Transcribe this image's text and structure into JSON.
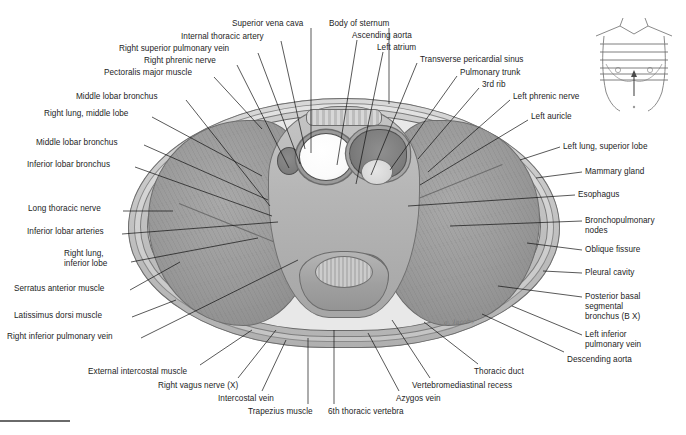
{
  "plate": {
    "title": "Transverse section of the thorax",
    "signature": "a. Jacobs"
  },
  "labels_top": [
    {
      "text": "Superior vena cava",
      "x": 232,
      "y": 19,
      "align": "l",
      "x1": 311,
      "y1": 28,
      "x2": 311,
      "y2": 153
    },
    {
      "text": "Body of sternum",
      "x": 329,
      "y": 19,
      "align": "l",
      "x1": 389,
      "y1": 28,
      "x2": 389,
      "y2": 104
    },
    {
      "text": "Ascending aorta",
      "x": 352,
      "y": 31,
      "align": "l",
      "x1": 357,
      "y1": 40,
      "x2": 337,
      "y2": 165
    },
    {
      "text": "Internal thoracic artery",
      "x": 181,
      "y": 32,
      "align": "l",
      "x1": 281,
      "y1": 41,
      "x2": 305,
      "y2": 149
    },
    {
      "text": "Left atrium",
      "x": 377,
      "y": 43,
      "align": "l",
      "x1": 383,
      "y1": 52,
      "x2": 356,
      "y2": 184
    },
    {
      "text": "Right superior pulmonary vein",
      "x": 119,
      "y": 44,
      "align": "l",
      "x1": 258,
      "y1": 53,
      "x2": 300,
      "y2": 164
    },
    {
      "text": "Transverse pericardial sinus",
      "x": 420,
      "y": 55,
      "align": "l",
      "x1": 417,
      "y1": 63,
      "x2": 371,
      "y2": 175
    },
    {
      "text": "Right phrenic nerve",
      "x": 144,
      "y": 56,
      "align": "l",
      "x1": 237,
      "y1": 65,
      "x2": 289,
      "y2": 168
    },
    {
      "text": "Pulmonary trunk",
      "x": 460,
      "y": 68,
      "align": "l",
      "x1": 457,
      "y1": 76,
      "x2": 390,
      "y2": 170
    },
    {
      "text": "3rd rib",
      "x": 482,
      "y": 80,
      "align": "l",
      "x1": 479,
      "y1": 88,
      "x2": 418,
      "y2": 159
    },
    {
      "text": "Pectoralis major muscle",
      "x": 104,
      "y": 68,
      "align": "l",
      "x1": 214,
      "y1": 77,
      "x2": 262,
      "y2": 129
    },
    {
      "text": "Left phrenic nerve",
      "x": 513,
      "y": 92,
      "align": "l",
      "x1": 510,
      "y1": 100,
      "x2": 428,
      "y2": 172
    },
    {
      "text": "Middle lobar bronchus",
      "x": 76,
      "y": 92,
      "align": "l",
      "x1": 186,
      "y1": 100,
      "x2": 270,
      "y2": 206
    },
    {
      "text": "Left auricle",
      "x": 531,
      "y": 112,
      "align": "l",
      "x1": 528,
      "y1": 120,
      "x2": 420,
      "y2": 185
    }
  ],
  "labels_left": [
    {
      "text": "Right lung, middle lobe",
      "x": 44,
      "y": 109,
      "align": "l",
      "x1": 152,
      "y1": 117,
      "x2": 262,
      "y2": 176
    },
    {
      "text": "Middle lobar bronchus",
      "x": 36,
      "y": 138,
      "align": "l",
      "x1": 144,
      "y1": 145,
      "x2": 268,
      "y2": 200
    },
    {
      "text": "Inferior lobar bronchus",
      "x": 27,
      "y": 160,
      "align": "l",
      "x1": 135,
      "y1": 167,
      "x2": 272,
      "y2": 216
    },
    {
      "text": "Long thoracic nerve",
      "x": 28,
      "y": 204,
      "align": "l",
      "x1": 123,
      "y1": 211,
      "x2": 173,
      "y2": 211
    },
    {
      "text": "Inferior lobar arteries",
      "x": 27,
      "y": 227,
      "align": "l",
      "x1": 122,
      "y1": 234,
      "x2": 278,
      "y2": 222
    },
    {
      "text": "Right lung,",
      "x": 64,
      "y": 249,
      "align": "l",
      "x1": 131,
      "y1": 262,
      "x2": 258,
      "y2": 238
    },
    {
      "text": "inferior lobe",
      "x": 64,
      "y": 259,
      "align": "l"
    },
    {
      "text": "Serratus anterior muscle",
      "x": 14,
      "y": 284,
      "align": "l",
      "x1": 130,
      "y1": 290,
      "x2": 180,
      "y2": 262
    },
    {
      "text": "Latissimus dorsi muscle",
      "x": 14,
      "y": 311,
      "align": "l",
      "x1": 132,
      "y1": 317,
      "x2": 176,
      "y2": 300
    },
    {
      "text": "Right inferior pulmonary vein",
      "x": 7,
      "y": 332,
      "align": "l",
      "x1": 141,
      "y1": 338,
      "x2": 298,
      "y2": 260
    }
  ],
  "labels_bottom": [
    {
      "text": "External intercostal muscle",
      "x": 88,
      "y": 367,
      "align": "l",
      "x1": 200,
      "y1": 365,
      "x2": 252,
      "y2": 330
    },
    {
      "text": "Right vagus nerve (X)",
      "x": 158,
      "y": 381,
      "align": "l",
      "x1": 238,
      "y1": 378,
      "x2": 276,
      "y2": 330
    },
    {
      "text": "Intercostal vein",
      "x": 218,
      "y": 394,
      "align": "l",
      "x1": 262,
      "y1": 391,
      "x2": 286,
      "y2": 340
    },
    {
      "text": "Trapezius muscle",
      "x": 248,
      "y": 407,
      "align": "l",
      "x1": 308,
      "y1": 404,
      "x2": 308,
      "y2": 338
    },
    {
      "text": "6th thoracic vertebra",
      "x": 328,
      "y": 407,
      "align": "l",
      "x1": 334,
      "y1": 404,
      "x2": 334,
      "y2": 330
    },
    {
      "text": "Azygos vein",
      "x": 396,
      "y": 394,
      "align": "l",
      "x1": 399,
      "y1": 391,
      "x2": 368,
      "y2": 333
    },
    {
      "text": "Vertebromediastinal recess",
      "x": 412,
      "y": 381,
      "align": "l",
      "x1": 430,
      "y1": 378,
      "x2": 392,
      "y2": 320
    },
    {
      "text": "Thoracic duct",
      "x": 474,
      "y": 367,
      "align": "l",
      "x1": 478,
      "y1": 364,
      "x2": 424,
      "y2": 322
    },
    {
      "text": "Descending aorta",
      "x": 567,
      "y": 355,
      "align": "l",
      "x1": 564,
      "y1": 352,
      "x2": 482,
      "y2": 314
    }
  ],
  "labels_right": [
    {
      "text": "Left lung, superior lobe",
      "x": 563,
      "y": 142,
      "align": "l",
      "x1": 560,
      "y1": 147,
      "x2": 520,
      "y2": 160
    },
    {
      "text": "Mammary gland",
      "x": 585,
      "y": 167,
      "align": "l",
      "x1": 582,
      "y1": 172,
      "x2": 536,
      "y2": 178
    },
    {
      "text": "Esophagus",
      "x": 578,
      "y": 190,
      "align": "l",
      "x1": 575,
      "y1": 195,
      "x2": 408,
      "y2": 206
    },
    {
      "text": "Bronchopulmonary",
      "x": 585,
      "y": 216,
      "align": "l",
      "x1": 582,
      "y1": 221,
      "x2": 450,
      "y2": 226
    },
    {
      "text": "nodes",
      "x": 585,
      "y": 226,
      "align": "l"
    },
    {
      "text": "Oblique fissure",
      "x": 585,
      "y": 245,
      "align": "l",
      "x1": 582,
      "y1": 250,
      "x2": 527,
      "y2": 243
    },
    {
      "text": "Pleural cavity",
      "x": 585,
      "y": 268,
      "align": "l",
      "x1": 582,
      "y1": 273,
      "x2": 543,
      "y2": 271
    },
    {
      "text": "Posterior basal",
      "x": 585,
      "y": 292,
      "align": "l",
      "x1": 582,
      "y1": 297,
      "x2": 498,
      "y2": 286
    },
    {
      "text": "segmental",
      "x": 585,
      "y": 302,
      "align": "l"
    },
    {
      "text": "bronchus (B X)",
      "x": 585,
      "y": 312,
      "align": "l"
    },
    {
      "text": "Left inferior",
      "x": 585,
      "y": 330,
      "align": "l",
      "x1": 582,
      "y1": 335,
      "x2": 512,
      "y2": 306
    },
    {
      "text": "pulmonary vein",
      "x": 585,
      "y": 340,
      "align": "l"
    }
  ],
  "torso_key": {
    "name": "torso-orientation-key",
    "section_lines": 6,
    "arrow": "section-level-arrow"
  }
}
